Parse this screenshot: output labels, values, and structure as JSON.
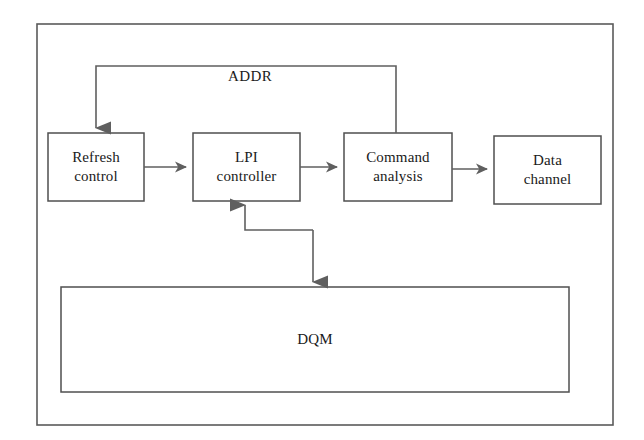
{
  "figure": {
    "type": "block-diagram",
    "title": "",
    "frame": {
      "label": ""
    },
    "colors": {
      "stroke": "#5a5a5a",
      "box_stroke": "#4f4f4f",
      "arrow_fill": "#5f5f5f",
      "text": "#1a1a1a",
      "background": "#ffffff"
    },
    "nodes": [
      {
        "id": "refresh_control",
        "label_lines": [
          "Refresh",
          "control"
        ],
        "x": 48,
        "y": 133,
        "w": 96,
        "h": 68
      },
      {
        "id": "lpi_controller",
        "label_lines": [
          "LPI",
          "controller"
        ],
        "x": 193,
        "y": 133,
        "w": 107,
        "h": 68
      },
      {
        "id": "command_analysis",
        "label_lines": [
          "Command",
          "analysis"
        ],
        "x": 344,
        "y": 133,
        "w": 108,
        "h": 68
      },
      {
        "id": "data_channel",
        "label_lines": [
          "Data",
          "channel"
        ],
        "x": 494,
        "y": 136,
        "w": 107,
        "h": 68
      },
      {
        "id": "dqm",
        "label_lines": [
          "DQM"
        ],
        "x": 61,
        "y": 287,
        "w": 508,
        "h": 105
      }
    ],
    "edges": [
      {
        "id": "refresh-to-lpi",
        "from": "refresh_control",
        "to": "lpi_controller",
        "label": "",
        "kind": "straight-right"
      },
      {
        "id": "lpi-to-command",
        "from": "lpi_controller",
        "to": "command_analysis",
        "label": "",
        "kind": "straight-right"
      },
      {
        "id": "command-to-data",
        "from": "command_analysis",
        "to": "data_channel",
        "label": "",
        "kind": "straight-right"
      },
      {
        "id": "command-to-refresh-addr",
        "from": "command_analysis",
        "to": "refresh_control",
        "label": "ADDR",
        "kind": "feedback-top"
      },
      {
        "id": "dqm-to-lpi",
        "from": "dqm",
        "to": "lpi_controller",
        "label": "",
        "kind": "feedback-bottom-up"
      },
      {
        "id": "lpi-to-dqm",
        "from": "lpi_controller",
        "to": "dqm",
        "label": "",
        "kind": "feedback-bottom-down"
      }
    ],
    "edge_labels": {
      "addr": "ADDR"
    }
  }
}
